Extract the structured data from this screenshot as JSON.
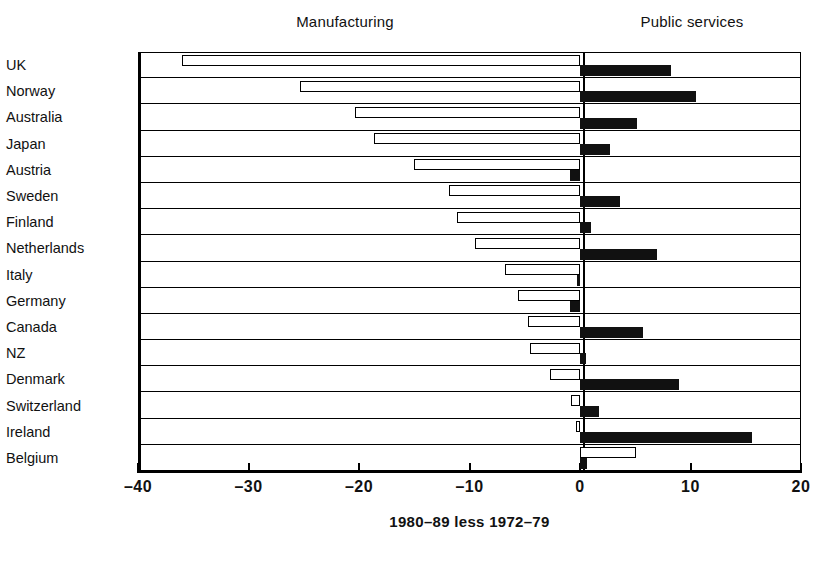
{
  "headings": {
    "manufacturing": "Manufacturing",
    "public_services": "Public services"
  },
  "caption": "1980–89 less 1972–79",
  "axis": {
    "ticks": [
      {
        "value": -40,
        "label": "–40"
      },
      {
        "value": -30,
        "label": "–30"
      },
      {
        "value": -20,
        "label": "–20"
      },
      {
        "value": -10,
        "label": "–10"
      },
      {
        "value": 0,
        "label": "0"
      },
      {
        "value": 10,
        "label": "10"
      },
      {
        "value": 20,
        "label": "20"
      }
    ],
    "min": -40,
    "max": 20
  },
  "colors": {
    "manufacturing_fill": "#ffffff",
    "manufacturing_stroke": "#000000",
    "public_services_fill": "#111111",
    "background": "#ffffff",
    "axis": "#000000"
  },
  "chart_data": {
    "type": "bar",
    "orientation": "horizontal",
    "title": "",
    "xlabel": "1980–89 less 1972–79",
    "ylabel": "",
    "xlim": [
      -40,
      20
    ],
    "grid": true,
    "legend_position": "top",
    "categories": [
      "UK",
      "Norway",
      "Australia",
      "Japan",
      "Austria",
      "Sweden",
      "Finland",
      "Netherlands",
      "Italy",
      "Germany",
      "Canada",
      "NZ",
      "Denmark",
      "Switzerland",
      "Ireland",
      "Belgium"
    ],
    "series": [
      {
        "name": "Manufacturing",
        "style": "open",
        "values": [
          -36.0,
          -25.3,
          -20.4,
          -18.6,
          -15.0,
          -11.9,
          -11.1,
          -9.5,
          -6.8,
          -5.6,
          -4.7,
          -4.5,
          -2.7,
          -0.8,
          -0.4,
          5.1
        ]
      },
      {
        "name": "Public services",
        "style": "filled",
        "values": [
          8.2,
          10.5,
          5.2,
          2.7,
          -0.9,
          3.6,
          1.0,
          7.0,
          -0.3,
          -0.9,
          5.7,
          0.5,
          9.0,
          1.7,
          15.6,
          0.6
        ]
      }
    ]
  }
}
